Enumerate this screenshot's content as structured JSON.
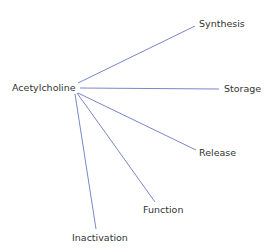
{
  "diagram": {
    "center": {
      "label": "Acetylcholine",
      "x": 12,
      "y": 83
    },
    "line_color": "#7b86c8",
    "branches": [
      {
        "label": "Synthesis",
        "x": 199,
        "y": 19,
        "line": [
          78,
          83,
          195,
          26
        ]
      },
      {
        "label": "Storage",
        "x": 224,
        "y": 84,
        "line": [
          80,
          88,
          219,
          89
        ]
      },
      {
        "label": "Release",
        "x": 199,
        "y": 148,
        "line": [
          78,
          93,
          196,
          150
        ]
      },
      {
        "label": "Function",
        "x": 143,
        "y": 205,
        "line": [
          77,
          93,
          155,
          202
        ]
      },
      {
        "label": "Inactivation",
        "x": 72,
        "y": 233,
        "line": [
          75,
          94,
          96,
          229
        ]
      }
    ]
  }
}
